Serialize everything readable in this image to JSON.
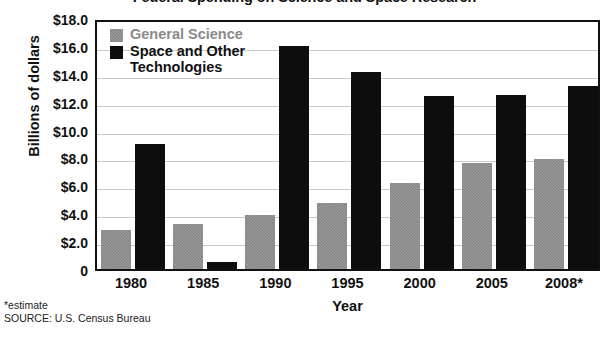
{
  "chart_data": {
    "type": "bar",
    "title": "Federal Spending on Science and Space Research",
    "xlabel": "Year",
    "ylabel": "Billions of dollars",
    "categories": [
      "1980",
      "1985",
      "1990",
      "1995",
      "2000",
      "2005",
      "2008*"
    ],
    "series": [
      {
        "name": "General Science",
        "color": "#808080",
        "values": [
          2.8,
          3.2,
          3.9,
          4.7,
          6.2,
          7.6,
          7.9
        ]
      },
      {
        "name": "Space and Other\nTechnologies",
        "color": "#0d0d0d",
        "values": [
          9.0,
          0.5,
          16.0,
          14.1,
          12.4,
          12.5,
          13.1
        ]
      }
    ],
    "ylim": [
      0,
      18
    ],
    "ytick_values": [
      18,
      16,
      14,
      12,
      10,
      8,
      6,
      4,
      2,
      0
    ],
    "ytick_labels": [
      "$18.0",
      "$16.0",
      "$14.0",
      "$12.0",
      "$10.0",
      "$8.0",
      "$6.0",
      "$4.0",
      "$2.0",
      "0"
    ],
    "grid": true,
    "legend_position": "upper left"
  },
  "footnotes": [
    "*estimate",
    "SOURCE: U.S. Census Bureau"
  ]
}
